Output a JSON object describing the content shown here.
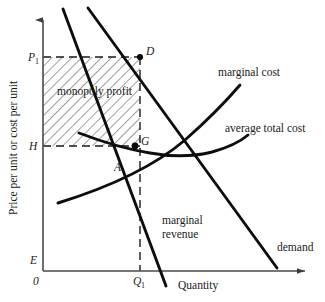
{
  "figure": {
    "type": "economics-diagram",
    "topic": "monopoly profit maximization"
  },
  "axes": {
    "y_label": "Price per unit or cost per unit",
    "x_label": "Quantity",
    "origin_label": "0",
    "y_ticks": [
      {
        "id": "P1",
        "label": "P",
        "subscript": "1"
      },
      {
        "id": "H",
        "label": "H",
        "subscript": ""
      },
      {
        "id": "E",
        "label": "E",
        "subscript": ""
      }
    ],
    "x_ticks": [
      {
        "id": "Q1",
        "label": "Q",
        "subscript": "1"
      }
    ]
  },
  "curves": [
    {
      "id": "marginal-cost",
      "label": "marginal cost"
    },
    {
      "id": "average-total-cost",
      "label": "average total cost"
    },
    {
      "id": "demand",
      "label": "demand"
    },
    {
      "id": "marginal-revenue",
      "label_line1": "marginal",
      "label_line2": "revenue"
    }
  ],
  "points": [
    {
      "id": "D",
      "label": "D"
    },
    {
      "id": "G",
      "label": "G"
    },
    {
      "id": "A",
      "label": "A"
    }
  ],
  "regions": [
    {
      "id": "monopoly-profit",
      "label": "monopoly profit",
      "fill": "hatched"
    }
  ],
  "colors": {
    "ink": "#1a1a1a",
    "axis": "#4a4a4a",
    "hatch": "#333333",
    "background": "#ffffff"
  }
}
